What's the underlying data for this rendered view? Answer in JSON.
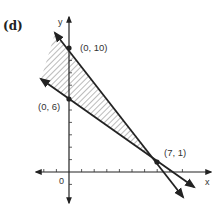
{
  "panel_label": "(d)",
  "axes": {
    "x_label": "x",
    "y_label": "y",
    "origin_label": "0"
  },
  "points": [
    {
      "label": "(0, 10)",
      "x": 0,
      "y": 10
    },
    {
      "label": "(0, 6)",
      "x": 0,
      "y": 6
    },
    {
      "label": "(7, 1)",
      "x": 7,
      "y": 1
    }
  ],
  "lines": [
    {
      "name": "line-through-0-10-and-7-1",
      "from": [
        0,
        10
      ],
      "to": [
        7,
        1
      ]
    },
    {
      "name": "line-through-0-6-and-7-1",
      "from": [
        0,
        6
      ],
      "to": [
        7,
        1
      ]
    }
  ],
  "shaded_region": "between the two lines, x <= 7 (hatched)",
  "colors": {
    "ink": "#222222",
    "hatch": "#555555",
    "background": "#ffffff"
  }
}
